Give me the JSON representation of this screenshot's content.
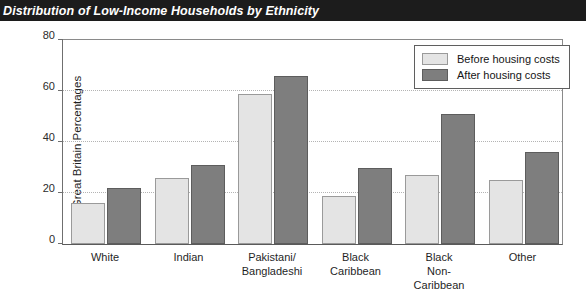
{
  "chart_data": {
    "type": "bar",
    "title": "Distribution of Low-Income Households by Ethnicity",
    "xlabel": "",
    "ylabel": "Great Britain Percentages",
    "ylim": [
      0,
      80
    ],
    "yticks": [
      0,
      20,
      40,
      60,
      80
    ],
    "ytick_labels": [
      "0",
      "20",
      "40",
      "60",
      "80"
    ],
    "grid": true,
    "legend_position": "top-right",
    "categories": [
      "White",
      "Pakistani/ Bangladeshi",
      "Indian",
      "Black Caribbean",
      "Black Non- Caribbean",
      "Other"
    ],
    "category_lines": [
      [
        "White"
      ],
      [
        "Indian"
      ],
      [
        "Pakistani/",
        "Bangladeshi"
      ],
      [
        "Black",
        "Caribbean"
      ],
      [
        "Black",
        "Non-",
        "Caribbean"
      ],
      [
        "Other"
      ]
    ],
    "series": [
      {
        "name": "Before housing costs",
        "color": "#e4e4e4",
        "values": [
          16,
          26,
          59,
          19,
          27,
          25
        ]
      },
      {
        "name": "After housing costs",
        "color": "#7e7e7e",
        "values": [
          22,
          31,
          66,
          30,
          51,
          36
        ]
      }
    ]
  },
  "legend": {
    "items": [
      {
        "label": "Before housing costs"
      },
      {
        "label": "After housing costs"
      }
    ]
  }
}
